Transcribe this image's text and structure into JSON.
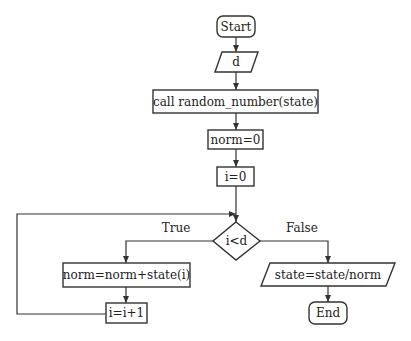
{
  "diagram": {
    "type": "flowchart",
    "nodes": {
      "start": {
        "label": "Start",
        "shape": "terminal"
      },
      "input_d": {
        "label": "d",
        "shape": "io"
      },
      "call": {
        "label": "call random_number(state)",
        "shape": "process"
      },
      "norm_init": {
        "label": "norm=0",
        "shape": "process"
      },
      "i_init": {
        "label": "i=0",
        "shape": "process"
      },
      "cond": {
        "label": "i<d",
        "shape": "decision"
      },
      "accumulate": {
        "label": "norm=norm+state(i)",
        "shape": "process"
      },
      "increment": {
        "label": "i=i+1",
        "shape": "process"
      },
      "normalize": {
        "label": "state=state/norm",
        "shape": "io"
      },
      "end": {
        "label": "End",
        "shape": "terminal"
      }
    },
    "edge_labels": {
      "true": "True",
      "false": "False"
    },
    "edges": [
      [
        "start",
        "input_d"
      ],
      [
        "input_d",
        "call"
      ],
      [
        "call",
        "norm_init"
      ],
      [
        "norm_init",
        "i_init"
      ],
      [
        "i_init",
        "cond"
      ],
      [
        "cond",
        "accumulate",
        "True"
      ],
      [
        "accumulate",
        "increment"
      ],
      [
        "increment",
        "cond"
      ],
      [
        "cond",
        "normalize",
        "False"
      ],
      [
        "normalize",
        "end"
      ]
    ]
  }
}
